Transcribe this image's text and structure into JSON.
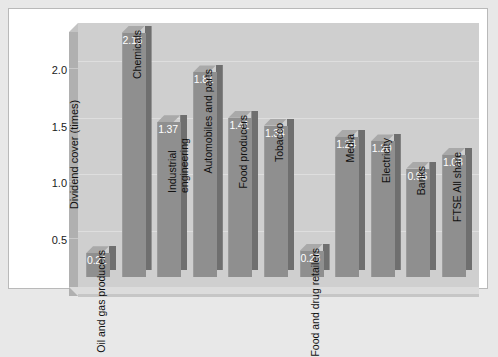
{
  "chart_data": {
    "type": "bar",
    "title": "",
    "subtitle": "",
    "xlabel": "",
    "ylabel": "Dividend cover (times)",
    "ylim": [
      0,
      2.35
    ],
    "yticks": [
      "0.5",
      "1.0",
      "1.5",
      "2.0"
    ],
    "ytick_values": [
      0.5,
      1.0,
      1.5,
      2.0
    ],
    "grid": true,
    "legend": "none",
    "style": "3d-bar-grayscale",
    "categories": [
      "Oil and gas producers",
      "Chemicals",
      "Industrial engineering",
      "Automobiles and parts",
      "Food producers",
      "Tobacco",
      "Food and drug retailers",
      "Media",
      "Electricity",
      "Banks",
      "FTSE All share"
    ],
    "values": [
      0.21,
      2.16,
      1.37,
      1.81,
      1.41,
      1.34,
      0.23,
      1.24,
      1.2,
      0.96,
      1.08
    ],
    "value_labels": [
      "0.21",
      "2.16",
      "1.37",
      "1.81",
      "1.41",
      "1.34",
      "0.23",
      "1.24",
      "1.20",
      "0.96",
      "1.08"
    ]
  },
  "colors": {
    "page_background": "#e8e8e8",
    "figure_background": "#ffffff",
    "plot_wall": "#cfcfcf",
    "bar_front": "#8f8f8f",
    "bar_side": "#6f6f6f",
    "bar_top": "#a9a9a9",
    "gridline": "#dedede",
    "value_text": "#ffffff",
    "axis_text": "#111111"
  }
}
